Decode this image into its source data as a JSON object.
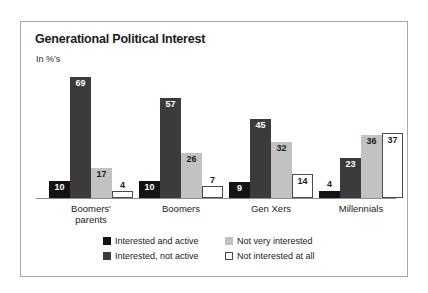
{
  "chart_data": {
    "type": "bar",
    "title": "Generational Political Interest",
    "ylabel": "In %'s",
    "xlabel": "",
    "grid": false,
    "legend_position": "bottom",
    "ylim": [
      0,
      75
    ],
    "categories": [
      "Boomers'\nparents",
      "Boomers",
      "Gen Xers",
      "Millennials"
    ],
    "series": [
      {
        "name": "Interested and active",
        "color": "#131313",
        "values": [
          10,
          10,
          9,
          4
        ]
      },
      {
        "name": "Interested, not active",
        "color": "#3b3b3b",
        "values": [
          69,
          57,
          45,
          23
        ]
      },
      {
        "name": "Not very interested",
        "color": "#c2c2c2",
        "values": [
          17,
          26,
          32,
          36
        ]
      },
      {
        "name": "Not interested at all",
        "color": "#ffffff",
        "values": [
          4,
          7,
          14,
          37
        ]
      }
    ]
  },
  "panel": {
    "border_color": "#a8a8a8",
    "background": "#ffffff"
  }
}
